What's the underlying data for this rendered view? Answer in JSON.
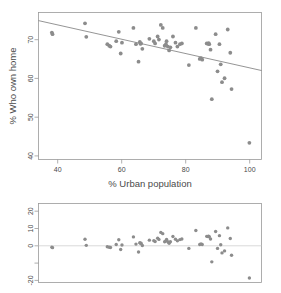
{
  "chart_data": [
    {
      "id": "scatter-main",
      "type": "scatter",
      "title": "",
      "xlabel": "% Urban population",
      "ylabel": "% Who own home",
      "xlim": [
        34,
        104
      ],
      "ylim": [
        38,
        76
      ],
      "xticks": [
        40,
        60,
        80,
        100
      ],
      "yticks": [
        40,
        50,
        60,
        70
      ],
      "grid": false,
      "legend": "none",
      "regression_line": {
        "x": [
          34,
          104
        ],
        "y": [
          73.9,
          61.0
        ]
      },
      "x": [
        38.2,
        38.4,
        48.6,
        49.0,
        55.6,
        56.2,
        56.6,
        58.4,
        59.2,
        59.8,
        60.2,
        63.8,
        64.6,
        65.4,
        65.8,
        66.0,
        66.2,
        66.6,
        68.8,
        70.2,
        70.6,
        71.4,
        71.8,
        72.4,
        73.0,
        73.6,
        74.0,
        74.2,
        74.6,
        75.0,
        75.4,
        76.2,
        77.0,
        77.6,
        78.4,
        79.0,
        81.2,
        83.4,
        84.6,
        85.0,
        85.4,
        86.8,
        87.2,
        87.4,
        87.6,
        88.0,
        88.4,
        89.6,
        90.2,
        90.8,
        91.2,
        91.6,
        92.4,
        93.4,
        94.2,
        94.6,
        100.2
      ],
      "y": [
        70.8,
        70.4,
        73.2,
        69.7,
        67.8,
        67.4,
        67.2,
        68.6,
        71.0,
        65.4,
        68.2,
        72.0,
        67.8,
        63.3,
        68.4,
        67.9,
        68.0,
        66.6,
        69.2,
        68.6,
        68.0,
        69.8,
        69.0,
        72.8,
        72.0,
        67.4,
        67.8,
        68.6,
        67.2,
        66.2,
        67.0,
        69.8,
        68.2,
        67.2,
        67.8,
        68.0,
        62.4,
        72.0,
        64.0,
        64.2,
        63.8,
        68.0,
        67.9,
        68.1,
        67.8,
        66.4,
        53.6,
        70.4,
        60.8,
        67.8,
        62.6,
        58.0,
        59.0,
        71.6,
        65.6,
        56.2,
        42.3
      ]
    },
    {
      "id": "residual-plot",
      "type": "scatter",
      "title": "",
      "xlabel": "",
      "ylabel": "",
      "xlim": [
        34,
        104
      ],
      "ylim": [
        -22,
        22
      ],
      "xticks": [],
      "yticks": [
        20,
        10,
        0,
        -10,
        -20
      ],
      "ytick_labels": [
        "20",
        "10",
        "0",
        "",
        "-20"
      ],
      "grid": false,
      "legend": "none",
      "zero_line": 0,
      "x": [
        38.2,
        38.4,
        48.6,
        49.0,
        55.6,
        56.2,
        56.6,
        58.4,
        59.2,
        59.8,
        60.2,
        63.8,
        64.6,
        65.4,
        65.8,
        66.0,
        66.2,
        66.6,
        68.8,
        70.2,
        70.6,
        71.4,
        71.8,
        72.4,
        73.0,
        73.6,
        74.0,
        74.2,
        74.6,
        75.0,
        75.4,
        76.2,
        77.0,
        77.6,
        78.4,
        79.0,
        81.2,
        83.4,
        84.6,
        85.0,
        85.4,
        86.8,
        87.2,
        87.4,
        87.6,
        88.0,
        88.4,
        89.6,
        90.2,
        90.8,
        91.2,
        91.6,
        92.4,
        93.4,
        94.2,
        94.6,
        100.2
      ],
      "y": [
        -2.3,
        -2.6,
        2.1,
        -1.3,
        -2.1,
        -2.4,
        -2.5,
        -0.8,
        1.8,
        -3.6,
        -1.1,
        3.4,
        -0.6,
        -5.0,
        0.2,
        -0.2,
        -0.1,
        -1.4,
        1.6,
        1.3,
        0.8,
        2.7,
        2.0,
        5.9,
        5.2,
        0.7,
        1.2,
        2.0,
        0.7,
        -0.2,
        0.7,
        3.6,
        2.1,
        1.2,
        1.9,
        2.2,
        -3.0,
        7.0,
        -0.8,
        -0.5,
        -0.8,
        3.7,
        3.6,
        3.8,
        3.5,
        2.2,
        -10.5,
        6.4,
        -3.0,
        4.1,
        -1.0,
        -5.5,
        -4.4,
        8.4,
        2.5,
        -6.8,
        -19.5
      ]
    }
  ],
  "labels": {
    "y_axis_title_main": "% Who own home",
    "x_axis_title_main": "% Urban population",
    "main_ytick_40": "40",
    "main_ytick_50": "50",
    "main_ytick_60": "60",
    "main_ytick_70": "70",
    "main_xtick_40": "40",
    "main_xtick_60": "60",
    "main_xtick_80": "80",
    "main_xtick_100": "100",
    "resid_ytick_20": "20",
    "resid_ytick_10": "10",
    "resid_ytick_0": "0",
    "resid_ytick_neg20": "-20"
  },
  "colors": {
    "point": "#8c8c8c",
    "line": "#7a7a7a",
    "frame": "#9a9a9a",
    "text": "#4a4a4a",
    "zero_line": "#c8c8c8",
    "background": "#ffffff"
  }
}
